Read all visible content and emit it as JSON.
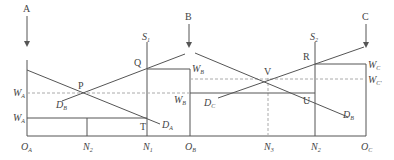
{
  "colors": {
    "line": "#555555",
    "dashed": "#aaaaaa",
    "text": "#444444"
  },
  "arrows": [
    {
      "label": "A",
      "x": 27
    },
    {
      "label": "B",
      "x": 189
    },
    {
      "label": "C",
      "x": 366
    }
  ],
  "axis_labels": {
    "OA": {
      "main": "O",
      "sub": "A"
    },
    "N2a": {
      "main": "N",
      "sub": "2"
    },
    "N1": {
      "main": "N",
      "sub": "1"
    },
    "OB": {
      "main": "O",
      "sub": "B"
    },
    "N3": {
      "main": "N",
      "sub": "3"
    },
    "N2b": {
      "main": "N",
      "sub": "2"
    },
    "OC": {
      "main": "O",
      "sub": "C"
    }
  },
  "wage_labels": {
    "WA_upper": {
      "main": "W",
      "sub": "A"
    },
    "WA_lower": {
      "main": "W",
      "sub": "A"
    },
    "WB_upper": {
      "main": "W",
      "sub": "B"
    },
    "WB_lower": {
      "main": "W",
      "sub": "B"
    },
    "WC": {
      "main": "W",
      "sub": "C"
    },
    "WC_prime": {
      "main": "W",
      "sub": "C'"
    }
  },
  "supply_labels": {
    "S1": {
      "main": "S",
      "sub": "1"
    },
    "S2": {
      "main": "S",
      "sub": "2"
    }
  },
  "demand_labels": {
    "DB_left": {
      "main": "D",
      "sub": "B"
    },
    "DA": {
      "main": "D",
      "sub": "A"
    },
    "DC": {
      "main": "D",
      "sub": "C"
    },
    "DB_right": {
      "main": "D",
      "sub": "B"
    }
  },
  "points": {
    "P": "P",
    "Q": "Q",
    "T": "T",
    "V": "V",
    "R": "R",
    "U": "U"
  }
}
